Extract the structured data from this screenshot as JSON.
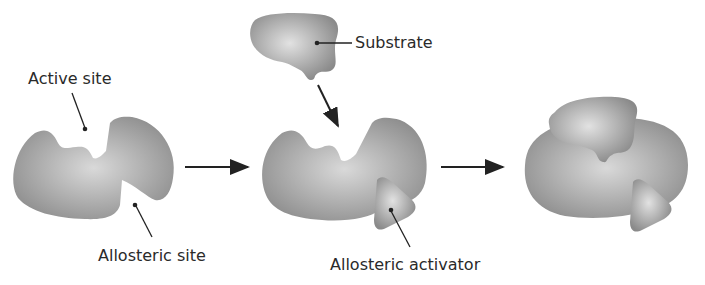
{
  "diagram": {
    "stages": [
      {
        "id": "enzyme",
        "description": "Enzyme with active site and allosteric site"
      },
      {
        "id": "binding",
        "description": "Allosteric activator binds; substrate approaches"
      },
      {
        "id": "complex",
        "description": "Substrate bound to active site with activator bound"
      }
    ],
    "labels": {
      "active_site": "Active site",
      "allosteric_site": "Allosteric site",
      "substrate": "Substrate",
      "allosteric_activator": "Allosteric activator"
    },
    "colors": {
      "shape_dark": "#8a8a8a",
      "shape_light": "#d8d8d8",
      "line": "#222222",
      "background": "#ffffff"
    }
  }
}
